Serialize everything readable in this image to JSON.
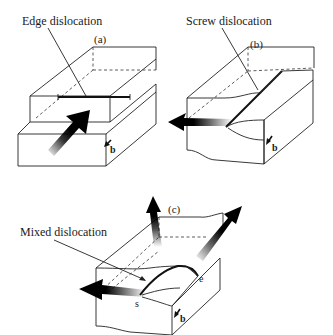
{
  "figure": {
    "panels": [
      {
        "id": "a",
        "tag": "(a)",
        "label": "Edge dislocation",
        "burgers_vector": "b"
      },
      {
        "id": "b",
        "tag": "(b)",
        "label": "Screw dislocation",
        "burgers_vector": "b"
      },
      {
        "id": "c",
        "tag": "(c)",
        "label": "Mixed dislocation",
        "burgers_vector": "b",
        "endpoint_screw": "s",
        "endpoint_edge": "e"
      }
    ]
  }
}
